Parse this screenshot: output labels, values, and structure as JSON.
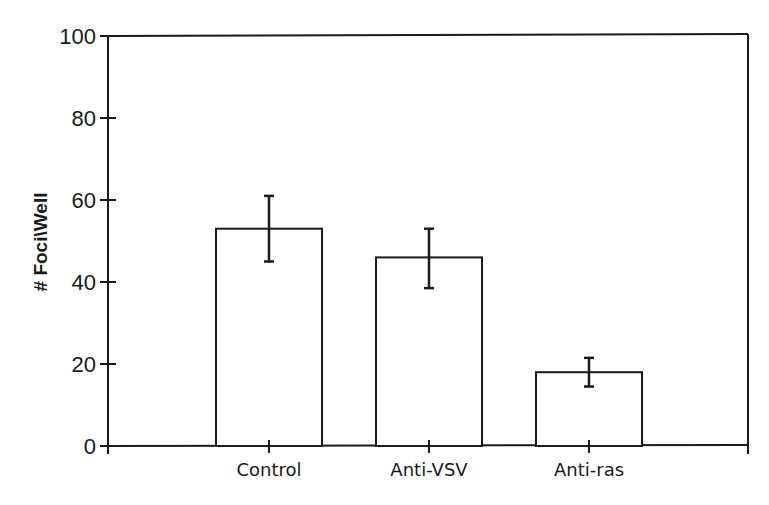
{
  "chart_data": {
    "type": "bar",
    "title": "",
    "xlabel": "",
    "ylabel": "# Foci\\Well",
    "ylim": [
      0,
      100
    ],
    "yticks": [
      0,
      20,
      40,
      60,
      80,
      100
    ],
    "grid": false,
    "legend": null,
    "categories": [
      "Control",
      "Anti-VSV",
      "Anti-ras"
    ],
    "values": [
      53,
      46,
      18
    ],
    "error_bars": [
      {
        "low": 45,
        "high": 61
      },
      {
        "low": 38.5,
        "high": 53
      },
      {
        "low": 14.5,
        "high": 21.5
      }
    ]
  },
  "colors": {
    "ink": "#1a1a1a",
    "bar_fill": "#ffffff",
    "background": "#ffffff"
  }
}
